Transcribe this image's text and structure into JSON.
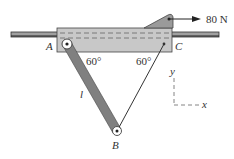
{
  "diagram": {
    "type": "mechanics-free-body",
    "labels": {
      "point_a": "A",
      "point_b": "B",
      "point_c": "C",
      "length": "l",
      "angle_a": "60°",
      "angle_c": "60°",
      "force": "80 N",
      "axis_y": "y",
      "axis_x": "x"
    },
    "colors": {
      "block_fill": "#c8c8c8",
      "rod_fill": "#8a8a8a",
      "link_fill": "#777777",
      "line": "#333333",
      "dash": "#666666"
    }
  }
}
